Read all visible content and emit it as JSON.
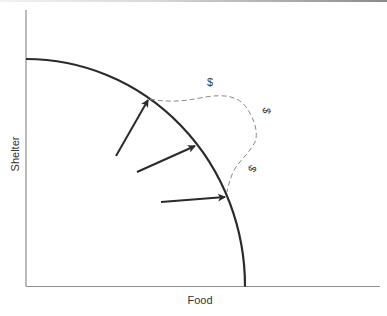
{
  "diagram": {
    "type": "production-possibilities-frontier",
    "x_axis_label": "Food",
    "y_axis_label": "Shelter",
    "annotations": {
      "dollar_top": "$",
      "dollar_right_upper": "$",
      "dollar_right_lower": "$"
    },
    "arrows": [
      {
        "from": [
          116,
          156
        ],
        "to": [
          149,
          99
        ]
      },
      {
        "from": [
          137,
          172
        ],
        "to": [
          196,
          146
        ]
      },
      {
        "from": [
          161,
          202
        ],
        "to": [
          226,
          197
        ]
      }
    ],
    "colors": {
      "curve": "#2b2b2b",
      "axis": "#8f8f8f",
      "dashed": "#8a8a8a",
      "text": "#333333"
    }
  }
}
